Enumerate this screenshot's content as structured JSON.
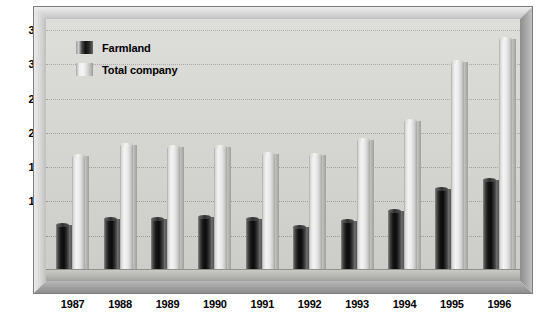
{
  "chart_data": {
    "type": "bar",
    "title": "",
    "subtitle": "",
    "xlabel": "",
    "ylabel": "",
    "categories": [
      "1987",
      "1988",
      "1989",
      "1990",
      "1991",
      "1992",
      "1993",
      "1994",
      "1995",
      "1996"
    ],
    "series": [
      {
        "name": "Farmland",
        "color": "#101010",
        "values": [
          650,
          750,
          750,
          780,
          740,
          630,
          710,
          860,
          1180,
          1320
        ]
      },
      {
        "name": "Total company",
        "color": "#f0f0f0",
        "values": [
          1660,
          1820,
          1790,
          1800,
          1690,
          1680,
          1900,
          2180,
          3040,
          3370
        ]
      }
    ],
    "ylim": [
      0,
      3500
    ],
    "ytick_values": [
      0,
      500,
      1000,
      1500,
      2000,
      2500,
      3000,
      3500
    ],
    "ytick_labels": [
      "0",
      "500",
      "1,000",
      "1,500",
      "2,000",
      "2,500",
      "3,000",
      "3,500"
    ],
    "grid": true,
    "grid_style": "dotted",
    "legend_position": "top-left",
    "legend_entries": [
      "Farmland",
      "Total company"
    ],
    "plot_background": "#d4d4d0",
    "frame_style": "3d-beveled"
  }
}
